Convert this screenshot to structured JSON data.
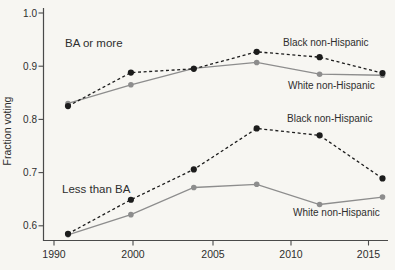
{
  "figure": {
    "background": "#f7f6f2",
    "title": ""
  },
  "chart_data": {
    "type": "line",
    "title": "",
    "xlabel": "",
    "ylabel": "Fraction voting",
    "x": [
      1996,
      2000,
      2004,
      2008,
      2012,
      2016
    ],
    "y_tick_labels": [
      "1.0",
      "0.9",
      "0.8",
      "0.7",
      "0.6"
    ],
    "x_ticks": [
      {
        "label": "1990",
        "px": 54
      },
      {
        "label": "2000",
        "px": 133
      },
      {
        "label": "2005",
        "px": 213
      },
      {
        "label": "2010",
        "px": 291
      },
      {
        "label": "2015",
        "px": 368.5
      }
    ],
    "ylim": [
      0.57,
      1.01
    ],
    "grid": false,
    "legend": "inline-annotations",
    "series": [
      {
        "name": "ba-or-more-black-non-hispanic",
        "group": "BA or more",
        "label": "Black non-Hispanic",
        "line_style": "dashed",
        "color": "#1c1c1c",
        "values": [
          0.825,
          0.888,
          0.895,
          0.927,
          0.917,
          0.887
        ]
      },
      {
        "name": "ba-or-more-white-non-hispanic",
        "group": "BA or more",
        "label": "White non-Hispanic",
        "line_style": "solid",
        "color": "#8d8d8d",
        "values": [
          0.83,
          0.865,
          0.896,
          0.907,
          0.885,
          0.883
        ]
      },
      {
        "name": "less-than-ba-black-non-hispanic",
        "group": "Less than BA",
        "label": "Black non-Hispanic",
        "line_style": "dashed",
        "color": "#1c1c1c",
        "values": [
          0.585,
          0.649,
          0.706,
          0.783,
          0.77,
          0.689
        ]
      },
      {
        "name": "less-than-ba-white-non-hispanic",
        "group": "Less than BA",
        "label": "White non-Hispanic",
        "line_style": "solid",
        "color": "#8d8d8d",
        "values": [
          0.583,
          0.621,
          0.672,
          0.678,
          0.64,
          0.654
        ]
      }
    ],
    "annotations": [
      {
        "id": "group-label-ba-or-more",
        "text": "BA or more",
        "x": 65,
        "y": 47,
        "size": 11.5
      },
      {
        "id": "group-label-less-than-ba",
        "text": "Less than BA",
        "x": 62,
        "y": 193,
        "size": 11.5
      },
      {
        "id": "series-label-ba-black",
        "text": "Black non-Hispanic",
        "x": 283,
        "y": 46,
        "size": 10
      },
      {
        "id": "series-label-ba-white",
        "text": "White non-Hispanic",
        "x": 288,
        "y": 89,
        "size": 10
      },
      {
        "id": "series-label-lt-black",
        "text": "Black non-Hispanic",
        "x": 287,
        "y": 122,
        "size": 10
      },
      {
        "id": "series-label-lt-white",
        "text": "White non-Hispanic",
        "x": 293,
        "y": 216,
        "size": 10
      }
    ],
    "layout_px": {
      "x1996": 68,
      "px_per_year": 15.725,
      "y_at_1": 13,
      "px_per_unit": 532,
      "spine_left": 43.5,
      "spine_top": 8,
      "spine_bottom": 240.5,
      "spine_right": 388,
      "tick_len": 5,
      "x_tick_label_y": 258,
      "y_tick_label_x": 37,
      "ylabel_x": 11,
      "ylabel_y": 131
    }
  },
  "colors": {
    "axis": "#4a4a4a",
    "text": "#2e2e2e",
    "background": "#f7f6f2"
  }
}
